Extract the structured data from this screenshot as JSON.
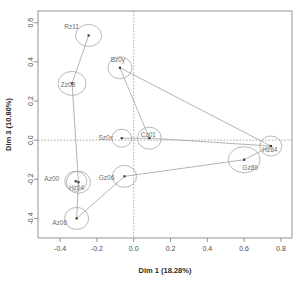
{
  "chart_data": {
    "type": "scatter",
    "title": "",
    "xlabel": "Dim 1 (18.28%)",
    "ylabel": "Dim 3 (10.80%)",
    "xlim": [
      -0.52,
      0.86
    ],
    "ylim": [
      -0.5,
      0.66
    ],
    "xticks": [
      -0.4,
      -0.2,
      0.0,
      0.2,
      0.4,
      0.6,
      0.8
    ],
    "xticklabels": [
      "-0.4",
      "-0.2",
      "0.0",
      "0.2",
      "0.4",
      "0.6",
      "0.8"
    ],
    "yticks": [
      -0.4,
      -0.2,
      0.0,
      0.2,
      0.4,
      0.6
    ],
    "yticklabels": [
      "-0.4",
      "-0.2",
      "0.0",
      "0.2",
      "0.4",
      "0.6"
    ],
    "grid": false,
    "reference_lines": {
      "x": 0.0,
      "y": 0.0,
      "style": "dotted"
    },
    "legend": "none",
    "ellipses": true,
    "points": [
      {
        "label": "Rz11",
        "x": -0.245,
        "y": 0.535,
        "rx": 13,
        "ry": 11,
        "label_dx": -17,
        "label_dy": -6
      },
      {
        "label": "Zz08",
        "x": -0.335,
        "y": 0.29,
        "rx": 14,
        "ry": 12,
        "label_dx": -4,
        "label_dy": 4
      },
      {
        "label": "Bz0y",
        "x": -0.075,
        "y": 0.37,
        "rx": 12,
        "ry": 11,
        "label_dx": -2,
        "label_dy": -6
      },
      {
        "label": "Sz0x",
        "x": -0.065,
        "y": 0.01,
        "rx": 10,
        "ry": 9,
        "label_dx": -16,
        "label_dy": 2
      },
      {
        "label": "Cz01",
        "x": 0.085,
        "y": 0.01,
        "rx": 12,
        "ry": 11,
        "label_dx": -1,
        "label_dy": -1
      },
      {
        "label": "Hz84",
        "x": 0.745,
        "y": -0.03,
        "rx": 11,
        "ry": 10,
        "label_dx": -1,
        "label_dy": 6
      },
      {
        "label": "Gz89",
        "x": 0.6,
        "y": -0.1,
        "rx": 16,
        "ry": 13,
        "label_dx": 6,
        "label_dy": 10
      },
      {
        "label": "Az00",
        "x": -0.315,
        "y": -0.21,
        "rx": 11,
        "ry": 10,
        "label_dx": -24,
        "label_dy": 0
      },
      {
        "label": "Hz04",
        "x": -0.3,
        "y": -0.215,
        "rx": 12,
        "ry": 11,
        "label_dx": -2,
        "label_dy": 8
      },
      {
        "label": "Gz06",
        "x": -0.05,
        "y": -0.185,
        "rx": 12,
        "ry": 11,
        "label_dx": -18,
        "label_dy": 4
      },
      {
        "label": "Az06",
        "x": -0.31,
        "y": -0.4,
        "rx": 12,
        "ry": 11,
        "label_dx": -17,
        "label_dy": 7
      }
    ],
    "links": [
      {
        "from": "Rz11",
        "to": "Zz08"
      },
      {
        "from": "Zz08",
        "to": "Hz04"
      },
      {
        "from": "Hz04",
        "to": "Az00"
      },
      {
        "from": "Bz0y",
        "to": "Cz01"
      },
      {
        "from": "Bz0y",
        "to": "Hz84"
      },
      {
        "from": "Sz0x",
        "to": "Cz01"
      },
      {
        "from": "Cz01",
        "to": "Hz84"
      },
      {
        "from": "Hz84",
        "to": "Gz89"
      },
      {
        "from": "Gz89",
        "to": "Gz06"
      },
      {
        "from": "Gz06",
        "to": "Az06"
      },
      {
        "from": "Az06",
        "to": "Hz04"
      }
    ]
  },
  "colors": {
    "frame": "#7a7a7a",
    "point": "#3a3a3a",
    "ellipse": "#9a9a9a",
    "link": "#8d8d8d",
    "label": "#6e6e6e",
    "background": "#ffffff"
  }
}
